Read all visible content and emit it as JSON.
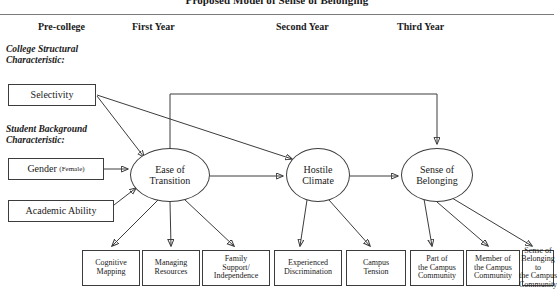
{
  "figure": {
    "title": "Proposed Model of Sense of Belonging"
  },
  "columns": [
    {
      "label": "Pre-college",
      "x": 38
    },
    {
      "label": "First Year",
      "x": 132
    },
    {
      "label": "Second Year",
      "x": 276
    },
    {
      "label": "Third Year",
      "x": 397
    }
  ],
  "captions": [
    {
      "line1": "College Structural",
      "line2": "Characteristic:",
      "x": 6,
      "y": 44
    },
    {
      "line1": "Student Background",
      "line2": "Characteristic:",
      "x": 6,
      "y": 124
    }
  ],
  "antecedents": [
    {
      "name": "selectivity",
      "label": "Selectivity",
      "x": 8,
      "y": 84,
      "w": 88,
      "h": 22
    },
    {
      "name": "gender",
      "label": "Gender",
      "sub": "(Female)",
      "x": 8,
      "y": 158,
      "w": 96,
      "h": 22
    },
    {
      "name": "academic-ability",
      "label": "Academic Ability",
      "x": 8,
      "y": 200,
      "w": 106,
      "h": 22
    }
  ],
  "constructs": [
    {
      "name": "ease-of-transition",
      "line1": "Ease of",
      "line2": "Transition",
      "cx": 170,
      "cy": 175,
      "rx": 40,
      "ry": 27
    },
    {
      "name": "hostile-climate",
      "line1": "Hostile",
      "line2": "Climate",
      "cx": 318,
      "cy": 175,
      "rx": 32,
      "ry": 27
    },
    {
      "name": "sense-of-belonging",
      "line1": "Sense of",
      "line2": "Belonging",
      "cx": 437,
      "cy": 175,
      "rx": 36,
      "ry": 27
    }
  ],
  "indicators": [
    {
      "name": "cognitive-mapping",
      "lines": [
        "Cognitive",
        "Mapping"
      ],
      "x": 82,
      "y": 250,
      "w": 58,
      "h": 36
    },
    {
      "name": "managing-resources",
      "lines": [
        "Managing",
        "Resources"
      ],
      "x": 142,
      "y": 250,
      "w": 58,
      "h": 36
    },
    {
      "name": "family-support-independence",
      "lines": [
        "Family",
        "Support/",
        "Independence"
      ],
      "x": 202,
      "y": 250,
      "w": 68,
      "h": 36
    },
    {
      "name": "experienced-discrimination",
      "lines": [
        "Experienced",
        "Discrimination"
      ],
      "x": 274,
      "y": 250,
      "w": 68,
      "h": 36
    },
    {
      "name": "campus-tension",
      "lines": [
        "Campus",
        "Tension"
      ],
      "x": 346,
      "y": 250,
      "w": 60,
      "h": 36
    },
    {
      "name": "part-of-the-campus-community",
      "lines": [
        "Part of",
        "the Campus",
        "Community"
      ],
      "x": 410,
      "y": 250,
      "w": 54,
      "h": 36
    },
    {
      "name": "member-of-the-campus-community",
      "lines": [
        "Member of",
        "the Campus",
        "Community"
      ],
      "x": 466,
      "y": 250,
      "w": 54,
      "h": 36
    },
    {
      "name": "sense-of-belonging-to-the-campus-community",
      "lines": [
        "Sense of",
        "Belonging to",
        "the Campus",
        "Community"
      ],
      "x": 522,
      "y": 250,
      "w": 32,
      "h": 36
    }
  ],
  "paths": [
    {
      "from": "Selectivity",
      "to": "Ease of Transition"
    },
    {
      "from": "Selectivity",
      "to": "Hostile Climate"
    },
    {
      "from": "Gender (Female)",
      "to": "Ease of Transition"
    },
    {
      "from": "Academic Ability",
      "to": "Ease of Transition"
    },
    {
      "from": "Ease of Transition",
      "to": "Hostile Climate"
    },
    {
      "from": "Ease of Transition",
      "to": "Sense of Belonging"
    },
    {
      "from": "Hostile Climate",
      "to": "Sense of Belonging"
    }
  ],
  "colors": {
    "stroke": "#3c3c3c",
    "rule": "#7a7a7a",
    "text": "#1a1a1a",
    "background": "#ffffff"
  }
}
